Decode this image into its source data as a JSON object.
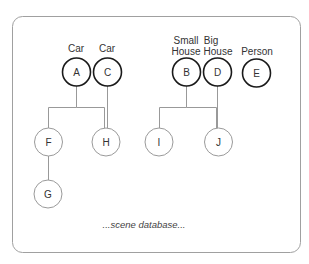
{
  "diagram": {
    "caption": "...scene database...",
    "roots": [
      {
        "id": "A",
        "label_lines": [
          "Car"
        ],
        "children": [
          "F",
          "H"
        ]
      },
      {
        "id": "C",
        "label_lines": [
          "Car"
        ],
        "children": [
          "H"
        ]
      },
      {
        "id": "B",
        "label_lines": [
          "Small",
          "House"
        ],
        "children": [
          "I",
          "J"
        ]
      },
      {
        "id": "D",
        "label_lines": [
          "Big",
          "House"
        ],
        "children": [
          "J"
        ]
      },
      {
        "id": "E",
        "label_lines": [
          "Person"
        ],
        "children": []
      }
    ],
    "children": [
      {
        "id": "F",
        "children": [
          "G"
        ]
      },
      {
        "id": "H",
        "children": []
      },
      {
        "id": "G",
        "children": []
      },
      {
        "id": "I",
        "children": []
      },
      {
        "id": "J",
        "children": []
      }
    ],
    "colors": {
      "root_stroke": "#1a1a1a",
      "child_stroke": "#9a9a9a",
      "edge": "#999999",
      "frame": "#a0a0a0"
    }
  }
}
